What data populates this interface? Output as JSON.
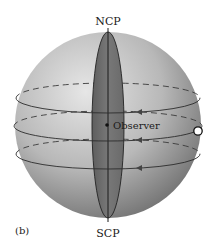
{
  "figure": {
    "panel_label": "(b)",
    "labels": {
      "north_pole": "NCP",
      "south_pole": "SCP",
      "observer": "Observer"
    },
    "elements": {
      "sphere": "celestial-sphere",
      "meridian": "meridian-plane",
      "circles": [
        "diurnal-circle-upper",
        "diurnal-circle-middle",
        "diurnal-circle-lower"
      ],
      "star": "star-marker",
      "arrows": "motion-arrows-westward"
    },
    "colors": {
      "sphere_light": "#dcdcdc",
      "sphere_dark": "#7a7a7a",
      "meridian_fill": "#6e6e6e",
      "line": "#2b2b2b",
      "star_fill": "#ffffff"
    }
  }
}
